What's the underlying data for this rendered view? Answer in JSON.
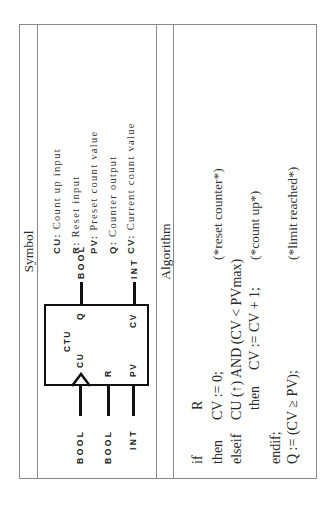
{
  "table": {
    "symbol_header": "Symbol",
    "algorithm_header": "Algorithm"
  },
  "function_block": {
    "name": "CTU",
    "inputs": [
      {
        "pin": "CU",
        "type": "BOOL",
        "edge": true
      },
      {
        "pin": "R",
        "type": "BOOL"
      },
      {
        "pin": "PV",
        "type": "INT"
      }
    ],
    "outputs": [
      {
        "pin": "Q",
        "type": "BOOL"
      },
      {
        "pin": "CV",
        "type": "INT"
      }
    ]
  },
  "descriptions": [
    {
      "key": "CU:",
      "text": "Count up input"
    },
    {
      "key": "R:",
      "text": "Reset input"
    },
    {
      "key": "PV:",
      "text": "Preset count value"
    },
    {
      "key": "Q:",
      "text": "Counter output"
    },
    {
      "key": "CV:",
      "text": "Current count value"
    }
  ],
  "algorithm": {
    "lines": [
      {
        "kw": "if",
        "code": "R",
        "comment": ""
      },
      {
        "kw": "then",
        "code": "CV := 0;",
        "comment": "(*reset counter*)"
      },
      {
        "kw": "elseif",
        "code": "CU (↑) AND (CV < PVmax)",
        "comment": ""
      },
      {
        "kw": "then",
        "code": "CV := CV + 1;",
        "comment": "(*count up*)"
      },
      {
        "kw": "endif;",
        "code": "",
        "comment": ""
      },
      {
        "kw": "Q := (CV ≥ PV);",
        "code": "",
        "comment": "(*limit reached*)"
      }
    ]
  }
}
